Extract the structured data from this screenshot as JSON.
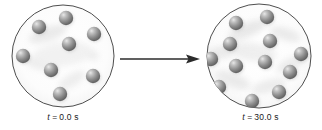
{
  "figure": {
    "background_color": "#ffffff"
  },
  "panels": [
    {
      "id": "before",
      "caption_variable": "t",
      "caption_equals": "=",
      "caption_value": "0.0",
      "caption_unit": "s",
      "caption_full": "t = 0.0 s",
      "particle_count": 8,
      "container": {
        "shape": "circle",
        "center_x": 55,
        "center_y": 52,
        "radius": 51,
        "outline_color": "#3a3a3a",
        "outline_width": 0.9,
        "fill_color": "#fbfbfb"
      },
      "particles": [
        {
          "cx": 31,
          "cy": 23,
          "r": 7.2
        },
        {
          "cx": 58,
          "cy": 14,
          "r": 7.2
        },
        {
          "cx": 86,
          "cy": 30,
          "r": 7.2
        },
        {
          "cx": 61,
          "cy": 40,
          "r": 7.2
        },
        {
          "cx": 15,
          "cy": 52,
          "r": 7.2
        },
        {
          "cx": 43,
          "cy": 66,
          "r": 7.2
        },
        {
          "cx": 85,
          "cy": 72,
          "r": 7.2
        },
        {
          "cx": 52,
          "cy": 90,
          "r": 7.2
        }
      ]
    },
    {
      "id": "after",
      "caption_variable": "t",
      "caption_equals": "=",
      "caption_value": "30.0",
      "caption_unit": "s",
      "caption_full": "t = 30.0 s",
      "particle_count": 12,
      "container": {
        "shape": "circle",
        "center_x": 56,
        "center_y": 52,
        "radius": 52,
        "outline_color": "#3a3a3a",
        "outline_width": 0.9,
        "fill_color": "#fbfbfb"
      },
      "particles": [
        {
          "cx": 33,
          "cy": 19,
          "r": 7.2
        },
        {
          "cx": 64,
          "cy": 13,
          "r": 7.2
        },
        {
          "cx": 27,
          "cy": 40,
          "r": 7.2
        },
        {
          "cx": 67,
          "cy": 37,
          "r": 7.2
        },
        {
          "cx": 8,
          "cy": 55,
          "r": 7.2
        },
        {
          "cx": 98,
          "cy": 50,
          "r": 7.2
        },
        {
          "cx": 33,
          "cy": 62,
          "r": 7.2
        },
        {
          "cx": 62,
          "cy": 58,
          "r": 7.2
        },
        {
          "cx": 87,
          "cy": 68,
          "r": 7.2
        },
        {
          "cx": 16,
          "cy": 83,
          "r": 7.2
        },
        {
          "cx": 76,
          "cy": 88,
          "r": 7.2
        },
        {
          "cx": 49,
          "cy": 97,
          "r": 7.2
        }
      ]
    }
  ],
  "arrow": {
    "direction": "right",
    "color": "#2b2b2b",
    "x_start": 2,
    "x_end": 82,
    "y": 9,
    "label": ""
  },
  "colors": {
    "sphere_dark": "#4d4d4d",
    "sphere_mid": "#8c8c8c",
    "sphere_light": "#d9d9d9",
    "sphere_highlight": "#f2f2f2",
    "outline": "#3a3a3a",
    "text": "#1a1a1a"
  }
}
